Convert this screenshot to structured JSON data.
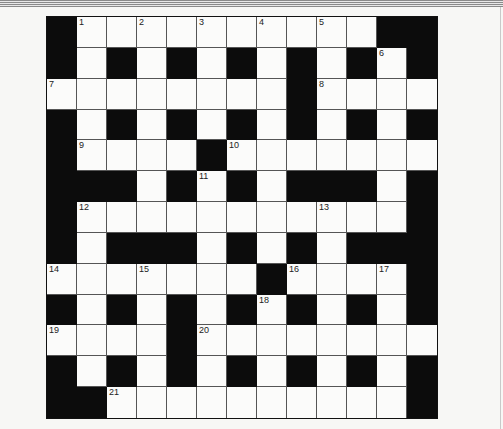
{
  "puzzle": {
    "rows": 13,
    "cols": 13,
    "layout": [
      "#WWWWWWWWWW##",
      "#W#W#W#W#W#W#",
      "WWWWWWWW#WWWW",
      "#W#W#W#W#W#W#",
      "#WWWW#WWWWWWW",
      "###W#W#W###W#",
      "#WWWWWWWWWWW#",
      "#W###W#W#W###",
      "WWWWWWW#WWWW#",
      "#W#W#W#W#W#W#",
      "WWWW#WWWWWWWW",
      "#W#W#W#W#W#W#",
      "##WWWWWWWWWW#"
    ],
    "numbers": [
      {
        "row": 0,
        "col": 1,
        "n": "1"
      },
      {
        "row": 0,
        "col": 3,
        "n": "2"
      },
      {
        "row": 0,
        "col": 5,
        "n": "3"
      },
      {
        "row": 0,
        "col": 7,
        "n": "4"
      },
      {
        "row": 0,
        "col": 9,
        "n": "5"
      },
      {
        "row": 1,
        "col": 11,
        "n": "6"
      },
      {
        "row": 2,
        "col": 0,
        "n": "7"
      },
      {
        "row": 2,
        "col": 9,
        "n": "8"
      },
      {
        "row": 4,
        "col": 1,
        "n": "9"
      },
      {
        "row": 4,
        "col": 6,
        "n": "10"
      },
      {
        "row": 5,
        "col": 5,
        "n": "11"
      },
      {
        "row": 6,
        "col": 1,
        "n": "12"
      },
      {
        "row": 6,
        "col": 9,
        "n": "13"
      },
      {
        "row": 8,
        "col": 0,
        "n": "14"
      },
      {
        "row": 8,
        "col": 3,
        "n": "15"
      },
      {
        "row": 8,
        "col": 8,
        "n": "16"
      },
      {
        "row": 8,
        "col": 11,
        "n": "17"
      },
      {
        "row": 9,
        "col": 7,
        "n": "18"
      },
      {
        "row": 10,
        "col": 0,
        "n": "19"
      },
      {
        "row": 10,
        "col": 5,
        "n": "20"
      },
      {
        "row": 12,
        "col": 2,
        "n": "21"
      }
    ],
    "colors": {
      "block": "#0c0c0c",
      "square": "#fbfbfa",
      "gridline": "#555555"
    }
  }
}
